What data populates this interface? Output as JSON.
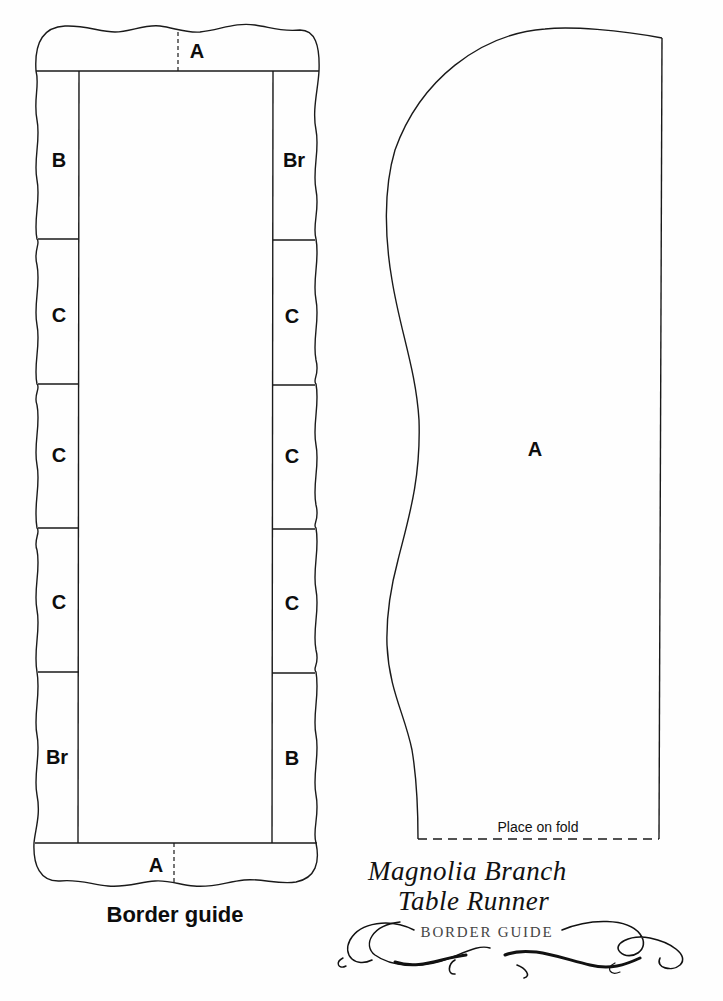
{
  "border_guide": {
    "top_band": {
      "label": "A"
    },
    "left_column": [
      {
        "label": "B"
      },
      {
        "label": "C"
      },
      {
        "label": "C"
      },
      {
        "label": "C"
      },
      {
        "label": "Br"
      }
    ],
    "right_column": [
      {
        "label": "Br"
      },
      {
        "label": "C"
      },
      {
        "label": "C"
      },
      {
        "label": "C"
      },
      {
        "label": "B"
      }
    ],
    "bottom_band": {
      "label": "A"
    },
    "caption": "Border guide"
  },
  "pattern_piece": {
    "label": "A",
    "fold_note": "Place on fold"
  },
  "title_block": {
    "line1": "Magnolia Branch",
    "line2": "Table Runner",
    "subtitle": "BORDER GUIDE"
  },
  "colors": {
    "line": "#1a1a1a",
    "background": "#ffffff",
    "subtitle": "#444444"
  }
}
